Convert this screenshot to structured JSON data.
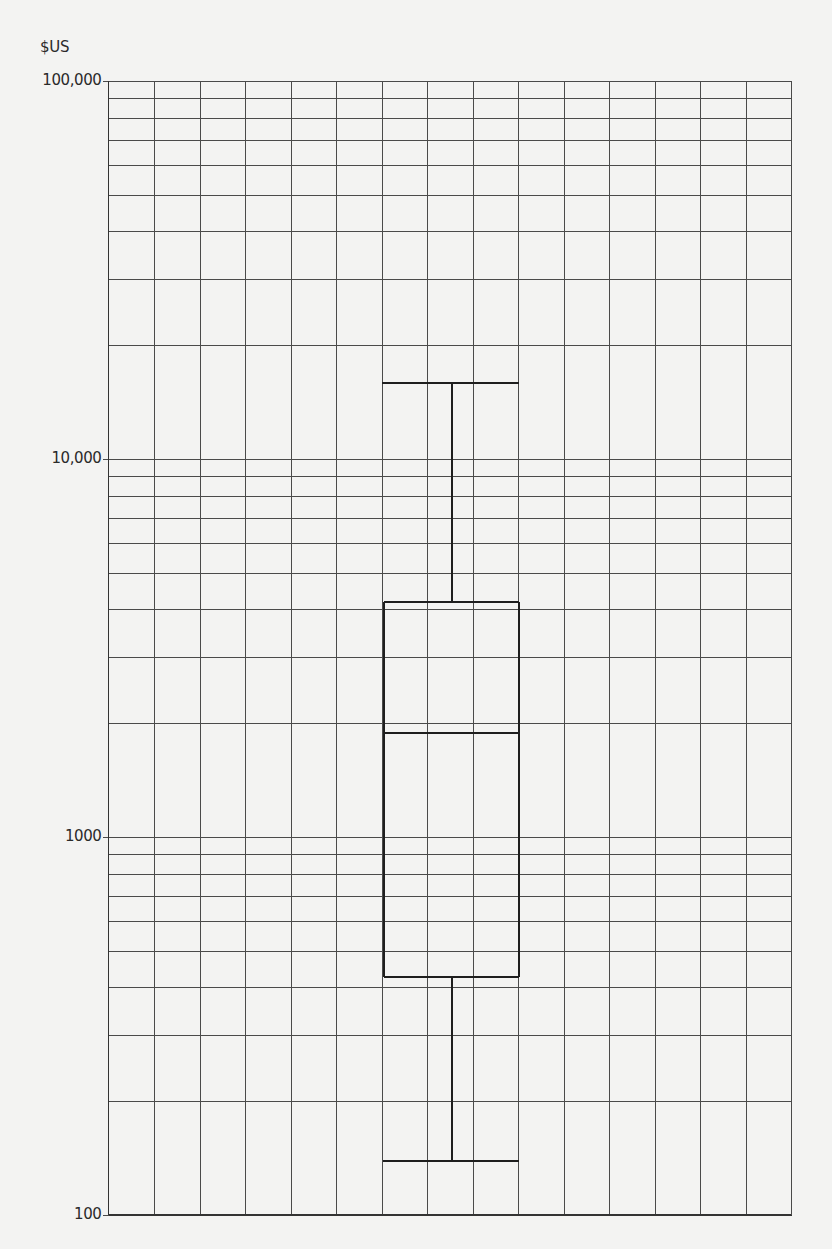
{
  "chart_data": {
    "type": "box",
    "title": "",
    "xlabel": "",
    "ylabel": "$US",
    "yscale": "log",
    "ylim": [
      100,
      100000
    ],
    "y_ticks": [
      {
        "value": 100000,
        "label": "100,000"
      },
      {
        "value": 10000,
        "label": "10,000"
      },
      {
        "value": 1000,
        "label": "1000"
      },
      {
        "value": 100,
        "label": "100"
      }
    ],
    "grid": {
      "on": true,
      "vertical_columns": 15,
      "horizontal": "log-minor (1-9 per decade)"
    },
    "legend": null,
    "series": [
      {
        "name": "",
        "whisker_low": 140,
        "q1": 430,
        "median": 1900,
        "q3": 4200,
        "whisker_high": 16000
      }
    ]
  },
  "labels": {
    "y_unit": "$US"
  },
  "style": {
    "background": "#f3f3f2",
    "grid_color": "#4a4a4a",
    "box_color": "#1e1e1e"
  }
}
